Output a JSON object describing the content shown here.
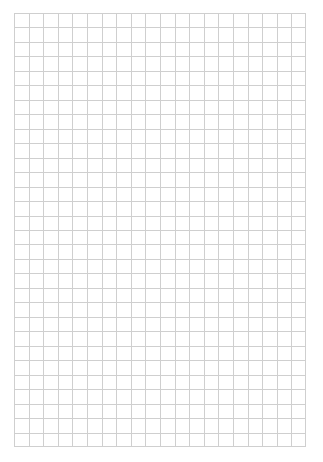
{
  "page": {
    "type": "graph-paper",
    "background_color": "#ffffff",
    "grid": {
      "columns": 20,
      "rows": 30,
      "cell_size_px": 14.6,
      "line_color": "#cfcfcf",
      "origin": [
        14,
        13
      ],
      "extent": [
        306,
        447
      ]
    }
  }
}
